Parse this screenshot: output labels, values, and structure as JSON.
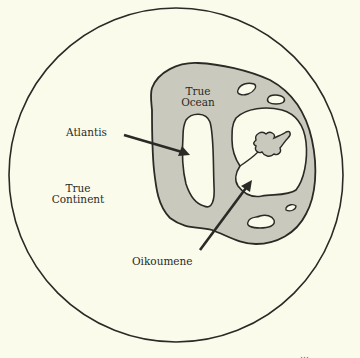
{
  "figure": {
    "title": "",
    "type": "concentric world diagram",
    "colors": {
      "background": "#fbfbec",
      "land": "#fbfbec",
      "ocean": "#c9c9bd",
      "outline": "#2a2a26"
    }
  },
  "labels": {
    "true_ocean": [
      "True",
      "Ocean"
    ],
    "atlantis": "Atlantis",
    "true_continent": [
      "True",
      "Continent"
    ],
    "oikoumene": "Oikoumene"
  },
  "credit": "…"
}
